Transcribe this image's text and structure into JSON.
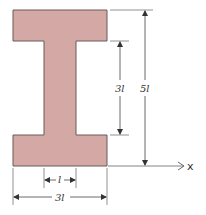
{
  "diagram": {
    "type": "I-beam cross-section",
    "colors": {
      "fill": "#d4a9a5",
      "outline": "#6b5858",
      "dimension_line": "#555555"
    },
    "dimensions": {
      "web_height": "3l",
      "total_height": "5l",
      "web_width": "l",
      "flange_width": "3l"
    },
    "axis": {
      "label": "x"
    }
  }
}
